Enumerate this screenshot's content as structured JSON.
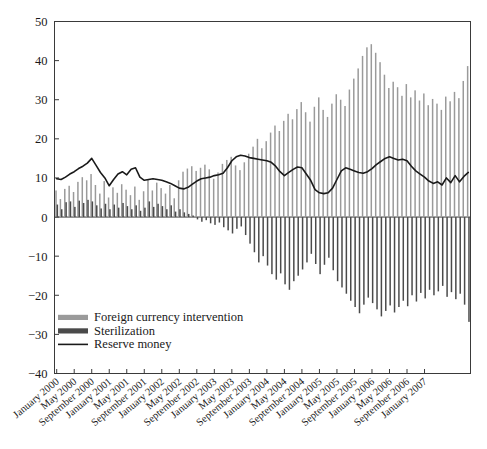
{
  "chart_data": {
    "type": "bar",
    "title": "",
    "subtitle": "",
    "xlabel": "",
    "ylabel": "",
    "ylim": [
      -40,
      50
    ],
    "ytick_labels": [
      "50",
      "40",
      "30",
      "20",
      "10",
      "0",
      "−10",
      "−20",
      "−30",
      "−40"
    ],
    "ytick_values": [
      50,
      40,
      30,
      20,
      10,
      0,
      -10,
      -20,
      -30,
      -40
    ],
    "grid": false,
    "legend_position": "lower-left-inside",
    "x_tick_labels": [
      "January 2000",
      "May 2000",
      "September 2000",
      "January 2001",
      "May 2001",
      "September 2001",
      "January 2002",
      "May 2002",
      "September 2002",
      "January 2003",
      "May 2003",
      "September 2003",
      "January 2004",
      "May 2004",
      "September 2004",
      "January 2005",
      "May 2005",
      "September 2005",
      "January 2006",
      "May 2006",
      "September 2006",
      "January 2007"
    ],
    "x_start": "January 2000",
    "x_end": "July 2007",
    "x_step_months": 1,
    "legend": [
      {
        "name": "Foreign currency intervention",
        "color": "#9a9a9a",
        "marker": "bar"
      },
      {
        "name": "Sterilization",
        "color": "#4a4a4a",
        "marker": "bar"
      },
      {
        "name": "Reserve money",
        "color": "#1a1a1a",
        "marker": "line"
      }
    ],
    "series": [
      {
        "name": "Foreign currency intervention",
        "type": "bar",
        "color": "#9a9a9a",
        "values": [
          6.8,
          4.6,
          7.2,
          8.0,
          6.4,
          9.0,
          10.2,
          9.4,
          11.0,
          8.2,
          6.0,
          9.2,
          5.0,
          7.6,
          6.2,
          8.4,
          7.0,
          5.6,
          7.8,
          4.4,
          6.6,
          9.6,
          6.8,
          8.8,
          7.4,
          6.0,
          8.2,
          4.8,
          9.4,
          11.6,
          12.4,
          13.0,
          11.8,
          12.6,
          13.4,
          12.2,
          9.8,
          11.4,
          13.6,
          14.6,
          15.4,
          13.2,
          12.0,
          14.0,
          16.2,
          18.0,
          20.0,
          17.6,
          19.4,
          21.6,
          23.4,
          22.0,
          24.6,
          26.4,
          25.0,
          27.6,
          29.4,
          26.8,
          24.4,
          28.2,
          30.6,
          27.4,
          25.6,
          29.0,
          31.4,
          30.0,
          28.4,
          32.6,
          35.4,
          38.0,
          41.2,
          43.4,
          44.2,
          42.0,
          39.6,
          36.4,
          33.0,
          34.6,
          33.2,
          31.0,
          34.0,
          30.6,
          32.4,
          29.8,
          31.6,
          28.6,
          30.2,
          29.0,
          27.4,
          30.8,
          29.6,
          32.0,
          30.4,
          34.8,
          38.6
        ]
      },
      {
        "name": "Sterilization",
        "type": "bar",
        "color": "#4a4a4a",
        "values": [
          3.2,
          2.0,
          3.8,
          4.0,
          2.6,
          4.2,
          3.6,
          4.4,
          4.0,
          3.0,
          2.2,
          3.4,
          2.0,
          3.2,
          2.4,
          3.6,
          2.8,
          2.0,
          3.0,
          1.6,
          2.4,
          4.0,
          2.6,
          3.4,
          2.8,
          2.0,
          3.0,
          1.4,
          2.0,
          1.2,
          0.8,
          0.4,
          -0.6,
          -1.2,
          -0.8,
          -1.6,
          -2.0,
          -1.4,
          -2.6,
          -3.4,
          -4.2,
          -3.0,
          -2.4,
          -4.6,
          -6.8,
          -9.0,
          -11.6,
          -10.0,
          -12.4,
          -14.6,
          -16.0,
          -14.4,
          -17.2,
          -18.6,
          -16.4,
          -15.0,
          -13.4,
          -11.6,
          -9.4,
          -12.0,
          -14.6,
          -12.2,
          -10.4,
          -13.6,
          -16.4,
          -18.0,
          -19.6,
          -21.4,
          -23.0,
          -24.6,
          -22.4,
          -20.6,
          -22.0,
          -23.6,
          -25.4,
          -24.0,
          -22.6,
          -24.4,
          -23.0,
          -21.4,
          -22.8,
          -20.0,
          -21.6,
          -19.4,
          -20.8,
          -18.6,
          -20.0,
          -19.0,
          -17.6,
          -20.4,
          -19.2,
          -21.0,
          -19.6,
          -22.4,
          -26.8
        ]
      },
      {
        "name": "Reserve money",
        "type": "line",
        "color": "#1a1a1a",
        "values": [
          9.8,
          9.6,
          10.2,
          11.0,
          11.6,
          12.4,
          13.0,
          13.8,
          15.0,
          13.2,
          11.4,
          10.0,
          8.0,
          9.6,
          11.0,
          11.6,
          10.8,
          12.2,
          12.6,
          10.2,
          9.4,
          9.6,
          9.8,
          9.6,
          9.4,
          9.0,
          8.6,
          8.0,
          7.4,
          7.2,
          7.6,
          8.4,
          9.2,
          9.8,
          10.0,
          10.2,
          10.6,
          10.8,
          11.2,
          12.6,
          14.4,
          15.4,
          15.8,
          15.6,
          15.2,
          15.0,
          14.8,
          14.6,
          14.4,
          14.0,
          13.0,
          11.6,
          10.6,
          11.4,
          12.2,
          12.8,
          12.6,
          11.0,
          9.4,
          7.0,
          6.2,
          6.0,
          6.2,
          7.4,
          9.6,
          11.8,
          12.6,
          12.2,
          11.8,
          11.4,
          11.2,
          11.6,
          12.4,
          13.4,
          14.2,
          15.0,
          15.4,
          15.0,
          14.6,
          14.8,
          14.4,
          13.0,
          11.8,
          11.0,
          10.2,
          9.2,
          8.6,
          9.0,
          8.2,
          10.0,
          8.8,
          10.6,
          9.0,
          10.4,
          11.4
        ]
      }
    ]
  }
}
